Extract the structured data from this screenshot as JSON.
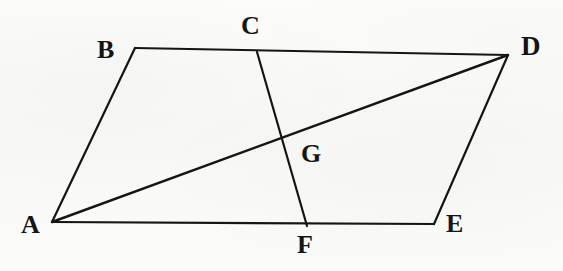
{
  "figure": {
    "kind": "plane-geometry-diagram",
    "background_color": "#fbfbfa",
    "stroke_color": "#151515",
    "label_color": "#151515",
    "canvas": {
      "width": 563,
      "height": 271
    }
  },
  "points": [
    {
      "id": "A",
      "label": "A",
      "x": 52,
      "y": 222,
      "label_x": 21,
      "label_y": 212,
      "font_size": 26
    },
    {
      "id": "B",
      "label": "B",
      "x": 135,
      "y": 48,
      "label_x": 97,
      "label_y": 37,
      "font_size": 26
    },
    {
      "id": "C",
      "label": "C",
      "x": 257,
      "y": 52,
      "label_x": 241,
      "label_y": 13,
      "font_size": 26
    },
    {
      "id": "D",
      "label": "D",
      "x": 508,
      "y": 55,
      "label_x": 521,
      "label_y": 33,
      "font_size": 27
    },
    {
      "id": "E",
      "label": "E",
      "x": 434,
      "y": 224,
      "label_x": 446,
      "label_y": 211,
      "font_size": 26
    },
    {
      "id": "F",
      "label": "F",
      "x": 307,
      "y": 226,
      "label_x": 297,
      "label_y": 232,
      "font_size": 26
    },
    {
      "id": "G",
      "label": "G",
      "x": 283,
      "y": 138,
      "label_x": 301,
      "label_y": 141,
      "font_size": 26
    }
  ],
  "segments": [
    {
      "id": "AB",
      "from": "A",
      "to": "B",
      "x1": 52,
      "y1": 222,
      "x2": 135,
      "y2": 48,
      "width": 2.2,
      "name": "segment-ab"
    },
    {
      "id": "BD",
      "from": "B",
      "to": "D",
      "x1": 135,
      "y1": 48,
      "x2": 508,
      "y2": 55,
      "width": 2.2,
      "name": "segment-bd"
    },
    {
      "id": "DE",
      "from": "D",
      "to": "E",
      "x1": 508,
      "y1": 55,
      "x2": 434,
      "y2": 224,
      "width": 2.2,
      "name": "segment-de"
    },
    {
      "id": "EA",
      "from": "E",
      "to": "A",
      "x1": 434,
      "y1": 224,
      "x2": 52,
      "y2": 222,
      "width": 2.2,
      "name": "segment-ea"
    },
    {
      "id": "AD",
      "from": "A",
      "to": "D",
      "x1": 52,
      "y1": 222,
      "x2": 508,
      "y2": 55,
      "width": 2.4,
      "name": "diagonal-ad"
    },
    {
      "id": "CF",
      "from": "C",
      "to": "F",
      "x1": 257,
      "y1": 52,
      "x2": 307,
      "y2": 226,
      "width": 2.2,
      "name": "transversal-cf"
    }
  ],
  "intersections": [
    {
      "id": "G",
      "of": [
        "AD",
        "CF"
      ],
      "x": 283,
      "y": 138
    },
    {
      "id": "C",
      "of": [
        "BD",
        "CF"
      ],
      "x": 257,
      "y": 52
    },
    {
      "id": "F",
      "of": [
        "EA",
        "CF"
      ],
      "x": 307,
      "y": 226
    }
  ]
}
